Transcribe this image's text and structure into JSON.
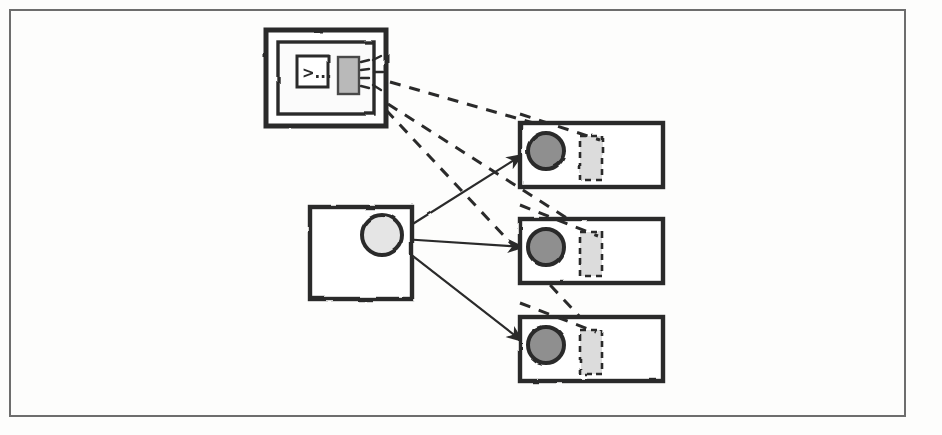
{
  "canvas": {
    "width": 942,
    "height": 435,
    "background": "#fdfdfc",
    "frame": {
      "x": 10,
      "y": 10,
      "width": 895,
      "height": 406,
      "stroke": "#6d6d6d",
      "stroke_width": 2
    }
  },
  "palette": {
    "ink": "#2b2b2b",
    "outline": "#3a3a3a",
    "light_fill": "#e8e8e8",
    "dark_fill": "#8f8f8f",
    "dashed_fill": "#dcdcdc",
    "paper": "#ffffff"
  },
  "nodes": {
    "controller": {
      "label": "controller-node",
      "outer_box": {
        "x": 266,
        "y": 30,
        "width": 120,
        "height": 96
      },
      "inner_box": {
        "x": 278,
        "y": 42,
        "width": 96,
        "height": 72
      },
      "terminal_icon": {
        "name": "terminal-icon",
        "x": 297,
        "y": 56,
        "width": 31,
        "height": 31,
        "prompt_text": ">..."
      },
      "broadcast_module": {
        "name": "broadcast-module-icon",
        "x": 338,
        "y": 57,
        "width": 21,
        "height": 37,
        "fill": "#b9b9b9",
        "signal_rays": 5
      }
    },
    "source": {
      "label": "source-node",
      "box": {
        "x": 310,
        "y": 207,
        "width": 102,
        "height": 92
      },
      "port": {
        "name": "source-port-circle",
        "cx": 382,
        "cy": 235,
        "r": 20,
        "fill": "#e5e5e5"
      }
    },
    "targets": [
      {
        "label": "target-node-1",
        "box": {
          "x": 520,
          "y": 123,
          "width": 143,
          "height": 64
        },
        "port": {
          "name": "target-port-circle",
          "cx": 546,
          "cy": 151,
          "r": 18,
          "fill": "#8f8f8f"
        },
        "slot": {
          "name": "target-slot-dashed",
          "x": 580,
          "y": 136,
          "width": 22,
          "height": 44,
          "fill": "#dcdcdc"
        }
      },
      {
        "label": "target-node-2",
        "box": {
          "x": 520,
          "y": 219,
          "width": 143,
          "height": 64
        },
        "port": {
          "name": "target-port-circle",
          "cx": 546,
          "cy": 247,
          "r": 18,
          "fill": "#8f8f8f"
        },
        "slot": {
          "name": "target-slot-dashed",
          "x": 580,
          "y": 232,
          "width": 22,
          "height": 44,
          "fill": "#dcdcdc"
        }
      },
      {
        "label": "target-node-3",
        "box": {
          "x": 520,
          "y": 317,
          "width": 143,
          "height": 64
        },
        "port": {
          "name": "target-port-circle",
          "cx": 546,
          "cy": 345,
          "r": 18,
          "fill": "#8f8f8f"
        },
        "slot": {
          "name": "target-slot-dashed",
          "x": 580,
          "y": 330,
          "width": 22,
          "height": 44,
          "fill": "#dcdcdc"
        }
      }
    ]
  },
  "edges": {
    "solid": [
      {
        "name": "solid-edge-source-to-target-1",
        "x1": 400,
        "y1": 232,
        "x2": 527,
        "y2": 152,
        "style": "solid",
        "arrow": true
      },
      {
        "name": "solid-edge-source-to-target-2",
        "x1": 402,
        "y1": 239,
        "x2": 528,
        "y2": 247,
        "style": "solid",
        "arrow": true
      },
      {
        "name": "solid-edge-source-to-target-3",
        "x1": 400,
        "y1": 246,
        "x2": 527,
        "y2": 344,
        "style": "solid",
        "arrow": true
      }
    ],
    "dashed": [
      {
        "name": "dashed-edge-controller-to-target-1",
        "x1": 390,
        "y1": 82,
        "x2": 600,
        "y2": 142,
        "style": "dashed"
      },
      {
        "name": "dashed-edge-controller-to-target-2",
        "x1": 388,
        "y1": 104,
        "x2": 598,
        "y2": 238,
        "style": "dashed"
      },
      {
        "name": "dashed-edge-controller-to-target-3",
        "x1": 386,
        "y1": 110,
        "x2": 596,
        "y2": 334,
        "style": "dashed"
      }
    ]
  }
}
